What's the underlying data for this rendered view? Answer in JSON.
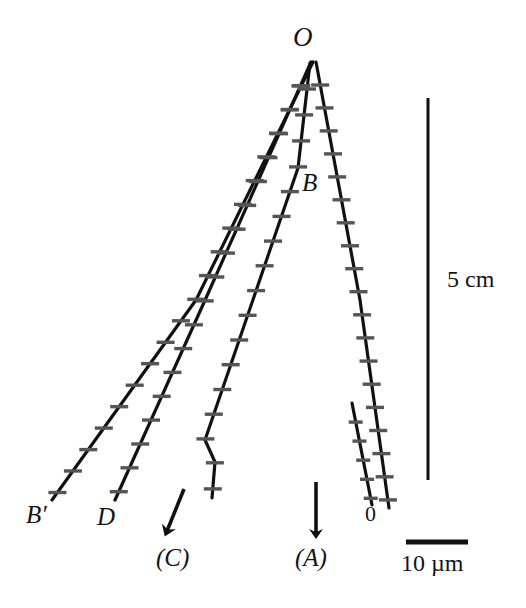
{
  "figure": {
    "type": "scientific-line-figure",
    "background_color": "#ffffff",
    "line_color": "#111111",
    "tick_color": "#555555",
    "labels": {
      "apex": "O",
      "branch": "B",
      "trace_b_prime": "B′",
      "trace_d": "D",
      "trace_c": "(C)",
      "trace_a": "(A)",
      "origin": "0",
      "vertical_scale": "5 cm",
      "horizontal_scale": "10 µm"
    }
  },
  "chart_data": {
    "type": "line",
    "title": "",
    "xlabel": "",
    "ylabel": "",
    "grid": false,
    "legend_position": "none",
    "scales": [
      {
        "name": "vertical-scale-bar",
        "label": "5 cm",
        "orientation": "vertical",
        "x": 428,
        "y1": 98,
        "y2": 480
      },
      {
        "name": "horizontal-scale-bar",
        "label": "10 µm",
        "orientation": "horizontal",
        "y": 542,
        "x1": 406,
        "x2": 468
      }
    ],
    "apex": {
      "label": "O",
      "x": 313,
      "y": 60
    },
    "series": [
      {
        "name": "B′",
        "end_label": "B′",
        "tick_count": 19,
        "points": [
          [
            313,
            62
          ],
          [
            196,
            300
          ],
          [
            52,
            500
          ]
        ]
      },
      {
        "name": "D",
        "end_label": "D",
        "tick_count": 18,
        "points": [
          [
            311,
            62
          ],
          [
            206,
            298
          ],
          [
            115,
            500
          ]
        ]
      },
      {
        "name": "(C)",
        "end_label": "(C)",
        "branch_label": "B",
        "tick_count": 17,
        "points": [
          [
            310,
            63
          ],
          [
            298,
            168
          ],
          [
            205,
            440
          ],
          [
            215,
            462
          ],
          [
            212,
            498
          ]
        ]
      },
      {
        "name": "(A)",
        "end_label": "(A)",
        "tick_count": 19,
        "points": [
          [
            316,
            62
          ],
          [
            360,
            300
          ],
          [
            389,
            508
          ]
        ]
      },
      {
        "name": "0-reference",
        "end_label": "0",
        "tick_count": 5,
        "points": [
          [
            352,
            403
          ],
          [
            372,
            505
          ]
        ]
      }
    ],
    "arrows": [
      {
        "name": "arrow-C",
        "x1": 184,
        "y1": 489,
        "x2": 167,
        "y2": 531,
        "points_to": "(C)"
      },
      {
        "name": "arrow-A",
        "x1": 316,
        "y1": 482,
        "x2": 316,
        "y2": 534,
        "points_to": "(A)"
      }
    ]
  }
}
